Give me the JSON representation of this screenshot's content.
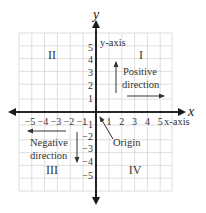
{
  "diagram": {
    "type": "coordinate-plane",
    "origin_px": [
      96,
      112
    ],
    "unit_px": 12.8,
    "grid_range": {
      "x": [
        -6,
        6
      ],
      "y": [
        -6,
        6
      ]
    },
    "colors": {
      "axis": "#1a1a1a",
      "grid": "#d6d6d6",
      "text": "#333333"
    },
    "axes": {
      "x_label": "x",
      "y_label": "y",
      "x_axis_caption": "x-axis",
      "y_axis_caption": "y-axis",
      "x_ticks_positive": [
        "1",
        "2",
        "3",
        "4",
        "5"
      ],
      "x_ticks_negative": [
        "−5",
        "−4",
        "−3",
        "−2",
        "−1"
      ],
      "y_ticks_positive": [
        "1",
        "2",
        "3",
        "4",
        "5"
      ],
      "y_ticks_negative": [
        "−1",
        "−2",
        "−3",
        "−4",
        "−5"
      ]
    },
    "quadrants": {
      "I": "I",
      "II": "II",
      "III": "III",
      "IV": "IV"
    },
    "annotations": {
      "positive_line1": "Positive",
      "positive_line2": "direction",
      "negative_line1": "Negative",
      "negative_line2": "direction",
      "origin": "Origin"
    }
  }
}
